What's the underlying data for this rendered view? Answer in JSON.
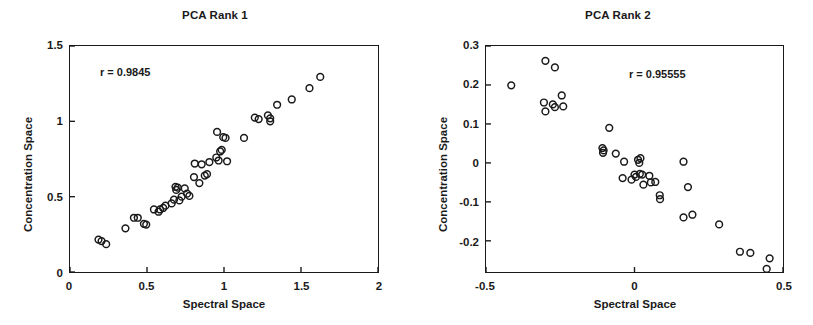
{
  "figure": {
    "background": "#ffffff",
    "ink_color": "#1a1a1a"
  },
  "chart_data": [
    {
      "type": "scatter",
      "title": "PCA Rank 1",
      "xlabel": "Spectral Space",
      "ylabel": "Concentration Space",
      "xlim": [
        0,
        2
      ],
      "ylim": [
        0,
        1.5
      ],
      "xticks": [
        0,
        0.5,
        1,
        1.5,
        2
      ],
      "xtick_labels": [
        "0",
        "0.5",
        "1",
        "1.5",
        "2"
      ],
      "yticks": [
        0,
        0.5,
        1,
        1.5
      ],
      "ytick_labels": [
        "0",
        "0.5",
        "1",
        "1.5"
      ],
      "grid": false,
      "legend": "none",
      "marker": "open-circle",
      "annotation": "r = 0.9845",
      "annotation_value": 0.9845,
      "annotation_position": "upper-left",
      "points": [
        [
          0.185,
          0.215
        ],
        [
          0.205,
          0.205
        ],
        [
          0.235,
          0.185
        ],
        [
          0.36,
          0.29
        ],
        [
          0.415,
          0.36
        ],
        [
          0.44,
          0.36
        ],
        [
          0.48,
          0.32
        ],
        [
          0.495,
          0.315
        ],
        [
          0.545,
          0.415
        ],
        [
          0.575,
          0.4
        ],
        [
          0.585,
          0.415
        ],
        [
          0.605,
          0.425
        ],
        [
          0.62,
          0.44
        ],
        [
          0.66,
          0.455
        ],
        [
          0.675,
          0.48
        ],
        [
          0.685,
          0.565
        ],
        [
          0.69,
          0.545
        ],
        [
          0.7,
          0.56
        ],
        [
          0.71,
          0.475
        ],
        [
          0.725,
          0.5
        ],
        [
          0.745,
          0.555
        ],
        [
          0.76,
          0.52
        ],
        [
          0.775,
          0.505
        ],
        [
          0.805,
          0.63
        ],
        [
          0.81,
          0.72
        ],
        [
          0.84,
          0.59
        ],
        [
          0.855,
          0.715
        ],
        [
          0.875,
          0.64
        ],
        [
          0.89,
          0.65
        ],
        [
          0.905,
          0.73
        ],
        [
          0.95,
          0.76
        ],
        [
          0.955,
          0.93
        ],
        [
          0.965,
          0.74
        ],
        [
          0.975,
          0.8
        ],
        [
          0.985,
          0.81
        ],
        [
          0.995,
          0.895
        ],
        [
          1.01,
          0.89
        ],
        [
          1.02,
          0.735
        ],
        [
          1.13,
          0.89
        ],
        [
          1.2,
          1.025
        ],
        [
          1.225,
          1.015
        ],
        [
          1.285,
          1.04
        ],
        [
          1.3,
          1.02
        ],
        [
          1.3,
          1.0
        ],
        [
          1.345,
          1.11
        ],
        [
          1.44,
          1.145
        ],
        [
          1.555,
          1.22
        ],
        [
          1.625,
          1.295
        ]
      ]
    },
    {
      "type": "scatter",
      "title": "PCA Rank 2",
      "xlabel": "Spectral Space",
      "ylabel": "Concentration Space",
      "xlim": [
        -0.5,
        0.5
      ],
      "ylim": [
        -0.28,
        0.3
      ],
      "xticks": [
        -0.5,
        0,
        0.5
      ],
      "xtick_labels": [
        "-0.5",
        "0",
        "0.5"
      ],
      "yticks": [
        -0.2,
        -0.1,
        0,
        0.1,
        0.2,
        0.3
      ],
      "ytick_labels": [
        "-0.2",
        "-0.1",
        "0",
        "0.1",
        "0.2",
        "0.3"
      ],
      "grid": false,
      "legend": "none",
      "marker": "open-circle",
      "annotation": "r = 0.95555",
      "annotation_value": 0.95555,
      "annotation_position": "upper-right",
      "points": [
        [
          -0.415,
          0.199
        ],
        [
          -0.3,
          0.262
        ],
        [
          -0.268,
          0.245
        ],
        [
          -0.305,
          0.155
        ],
        [
          -0.3,
          0.132
        ],
        [
          -0.275,
          0.15
        ],
        [
          -0.268,
          0.143
        ],
        [
          -0.245,
          0.173
        ],
        [
          -0.24,
          0.145
        ],
        [
          -0.085,
          0.09
        ],
        [
          -0.108,
          0.038
        ],
        [
          -0.106,
          0.026
        ],
        [
          -0.104,
          0.032
        ],
        [
          -0.063,
          0.024
        ],
        [
          -0.035,
          0.003
        ],
        [
          -0.04,
          -0.039
        ],
        [
          -0.01,
          -0.043
        ],
        [
          0.0,
          -0.03
        ],
        [
          0.005,
          -0.036
        ],
        [
          0.012,
          0.008
        ],
        [
          0.016,
          0.0
        ],
        [
          0.02,
          0.012
        ],
        [
          0.018,
          -0.028
        ],
        [
          0.026,
          -0.03
        ],
        [
          0.03,
          -0.056
        ],
        [
          0.05,
          -0.033
        ],
        [
          0.055,
          -0.05
        ],
        [
          0.07,
          -0.049
        ],
        [
          0.085,
          -0.083
        ],
        [
          0.086,
          -0.093
        ],
        [
          0.165,
          0.003
        ],
        [
          0.18,
          -0.062
        ],
        [
          0.165,
          -0.14
        ],
        [
          0.195,
          -0.133
        ],
        [
          0.285,
          -0.158
        ],
        [
          0.355,
          -0.228
        ],
        [
          0.39,
          -0.231
        ],
        [
          0.455,
          -0.245
        ],
        [
          0.445,
          -0.272
        ]
      ]
    }
  ]
}
